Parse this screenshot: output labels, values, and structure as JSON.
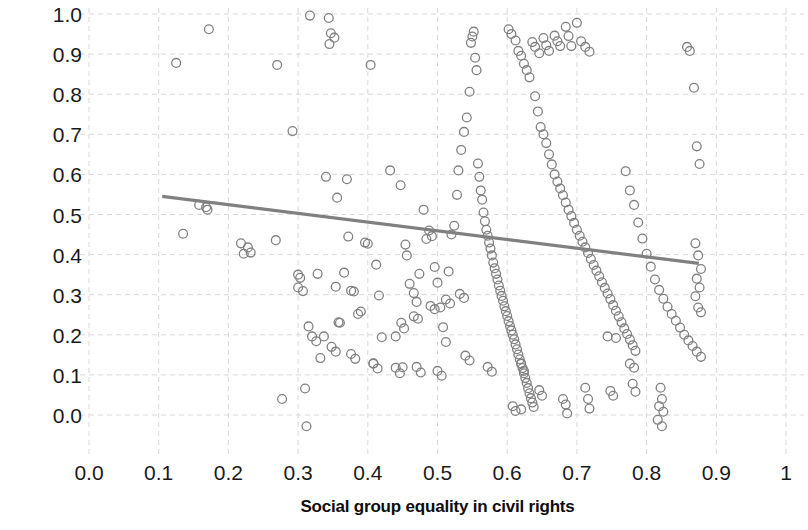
{
  "chart_data": {
    "type": "scatter",
    "title": "",
    "xlabel": "Social group equality in civil rights",
    "ylabel": "Female/male ratio",
    "xlim": [
      0.0,
      1.0
    ],
    "ylim": [
      -0.06,
      1.04
    ],
    "xticks": [
      "0.0",
      "0.1",
      "0.2",
      "0.3",
      "0.4",
      "0.5",
      "0.6",
      "0.7",
      "0.8",
      "0.9",
      "1"
    ],
    "xtick_values": [
      0.0,
      0.1,
      0.2,
      0.3,
      0.4,
      0.5,
      0.6,
      0.7,
      0.8,
      0.9,
      1.0
    ],
    "yticks": [
      "0.0",
      "0.1",
      "0.2",
      "0.3",
      "0.4",
      "0.5",
      "0.6",
      "0.7",
      "0.8",
      "0.9",
      "1.0"
    ],
    "ytick_values": [
      0.0,
      0.1,
      0.2,
      0.3,
      0.4,
      0.5,
      0.6,
      0.7,
      0.8,
      0.9,
      1.0
    ],
    "grid": true,
    "grid_style": "dashed",
    "grid_color": "#d9d9d9",
    "legend": "none",
    "marker": {
      "style": "open-circle",
      "radius": 4.4,
      "stroke": "#808080",
      "stroke_width": 1.3,
      "fill": "none"
    },
    "trendline": {
      "type": "linear",
      "color": "#808080",
      "width": 3.2,
      "x_start": 0.105,
      "y_start": 0.545,
      "x_end": 0.875,
      "y_end": 0.378,
      "slope": -0.217,
      "intercept": 0.568
    },
    "n_points": 270,
    "points": [
      [
        0.125,
        0.878
      ],
      [
        0.172,
        0.962
      ],
      [
        0.158,
        0.524
      ],
      [
        0.168,
        0.518
      ],
      [
        0.17,
        0.512
      ],
      [
        0.135,
        0.452
      ],
      [
        0.218,
        0.428
      ],
      [
        0.228,
        0.418
      ],
      [
        0.222,
        0.402
      ],
      [
        0.232,
        0.405
      ],
      [
        0.268,
        0.436
      ],
      [
        0.277,
        0.04
      ],
      [
        0.27,
        0.873
      ],
      [
        0.292,
        0.708
      ],
      [
        0.3,
        0.35
      ],
      [
        0.303,
        0.342
      ],
      [
        0.3,
        0.318
      ],
      [
        0.307,
        0.309
      ],
      [
        0.31,
        0.066
      ],
      [
        0.312,
        -0.028
      ],
      [
        0.315,
        0.221
      ],
      [
        0.317,
        0.996
      ],
      [
        0.328,
        0.352
      ],
      [
        0.332,
        0.142
      ],
      [
        0.337,
        0.196
      ],
      [
        0.34,
        0.594
      ],
      [
        0.344,
        0.99
      ],
      [
        0.347,
        0.952
      ],
      [
        0.345,
        0.925
      ],
      [
        0.352,
        0.941
      ],
      [
        0.354,
        0.32
      ],
      [
        0.356,
        0.542
      ],
      [
        0.358,
        0.231
      ],
      [
        0.36,
        0.23
      ],
      [
        0.366,
        0.355
      ],
      [
        0.37,
        0.588
      ],
      [
        0.372,
        0.445
      ],
      [
        0.376,
        0.31
      ],
      [
        0.38,
        0.308
      ],
      [
        0.386,
        0.252
      ],
      [
        0.39,
        0.258
      ],
      [
        0.396,
        0.43
      ],
      [
        0.4,
        0.427
      ],
      [
        0.404,
        0.873
      ],
      [
        0.408,
        0.129
      ],
      [
        0.412,
        0.375
      ],
      [
        0.416,
        0.298
      ],
      [
        0.42,
        0.194
      ],
      [
        0.432,
        0.61
      ],
      [
        0.44,
        0.196
      ],
      [
        0.447,
        0.573
      ],
      [
        0.45,
        0.119
      ],
      [
        0.454,
        0.425
      ],
      [
        0.456,
        0.398
      ],
      [
        0.46,
        0.327
      ],
      [
        0.466,
        0.304
      ],
      [
        0.47,
        0.282
      ],
      [
        0.474,
        0.352
      ],
      [
        0.48,
        0.512
      ],
      [
        0.484,
        0.439
      ],
      [
        0.488,
        0.46
      ],
      [
        0.492,
        0.446
      ],
      [
        0.496,
        0.369
      ],
      [
        0.5,
        0.33
      ],
      [
        0.504,
        0.268
      ],
      [
        0.508,
        0.219
      ],
      [
        0.512,
        0.182
      ],
      [
        0.516,
        0.358
      ],
      [
        0.52,
        0.45
      ],
      [
        0.524,
        0.472
      ],
      [
        0.528,
        0.549
      ],
      [
        0.53,
        0.61
      ],
      [
        0.534,
        0.661
      ],
      [
        0.538,
        0.706
      ],
      [
        0.542,
        0.742
      ],
      [
        0.546,
        0.806
      ],
      [
        0.548,
        0.928
      ],
      [
        0.55,
        0.944
      ],
      [
        0.552,
        0.956
      ],
      [
        0.554,
        0.891
      ],
      [
        0.556,
        0.86
      ],
      [
        0.558,
        0.627
      ],
      [
        0.56,
        0.594
      ],
      [
        0.562,
        0.56
      ],
      [
        0.564,
        0.537
      ],
      [
        0.566,
        0.505
      ],
      [
        0.568,
        0.483
      ],
      [
        0.57,
        0.462
      ],
      [
        0.572,
        0.447
      ],
      [
        0.574,
        0.43
      ],
      [
        0.576,
        0.415
      ],
      [
        0.578,
        0.398
      ],
      [
        0.58,
        0.38
      ],
      [
        0.582,
        0.366
      ],
      [
        0.584,
        0.352
      ],
      [
        0.586,
        0.338
      ],
      [
        0.588,
        0.323
      ],
      [
        0.59,
        0.31
      ],
      [
        0.592,
        0.297
      ],
      [
        0.594,
        0.285
      ],
      [
        0.596,
        0.271
      ],
      [
        0.598,
        0.259
      ],
      [
        0.6,
        0.247
      ],
      [
        0.602,
        0.234
      ],
      [
        0.604,
        0.222
      ],
      [
        0.606,
        0.211
      ],
      [
        0.608,
        0.2
      ],
      [
        0.61,
        0.189
      ],
      [
        0.612,
        0.176
      ],
      [
        0.614,
        0.164
      ],
      [
        0.616,
        0.151
      ],
      [
        0.618,
        0.139
      ],
      [
        0.62,
        0.128
      ],
      [
        0.622,
        0.117
      ],
      [
        0.624,
        0.104
      ],
      [
        0.626,
        0.092
      ],
      [
        0.628,
        0.08
      ],
      [
        0.63,
        0.067
      ],
      [
        0.632,
        0.054
      ],
      [
        0.634,
        0.042
      ],
      [
        0.636,
        0.031
      ],
      [
        0.638,
        0.02
      ],
      [
        0.608,
        0.022
      ],
      [
        0.612,
        0.01
      ],
      [
        0.62,
        0.014
      ],
      [
        0.602,
        0.962
      ],
      [
        0.606,
        0.95
      ],
      [
        0.612,
        0.934
      ],
      [
        0.616,
        0.908
      ],
      [
        0.62,
        0.896
      ],
      [
        0.624,
        0.876
      ],
      [
        0.628,
        0.86
      ],
      [
        0.632,
        0.842
      ],
      [
        0.64,
        0.795
      ],
      [
        0.644,
        0.757
      ],
      [
        0.648,
        0.718
      ],
      [
        0.652,
        0.7
      ],
      [
        0.656,
        0.678
      ],
      [
        0.66,
        0.65
      ],
      [
        0.664,
        0.625
      ],
      [
        0.668,
        0.6
      ],
      [
        0.672,
        0.582
      ],
      [
        0.676,
        0.565
      ],
      [
        0.68,
        0.548
      ],
      [
        0.684,
        0.53
      ],
      [
        0.688,
        0.512
      ],
      [
        0.692,
        0.496
      ],
      [
        0.696,
        0.479
      ],
      [
        0.7,
        0.462
      ],
      [
        0.704,
        0.447
      ],
      [
        0.708,
        0.432
      ],
      [
        0.712,
        0.418
      ],
      [
        0.716,
        0.404
      ],
      [
        0.72,
        0.389
      ],
      [
        0.724,
        0.374
      ],
      [
        0.728,
        0.36
      ],
      [
        0.732,
        0.346
      ],
      [
        0.736,
        0.331
      ],
      [
        0.74,
        0.317
      ],
      [
        0.744,
        0.303
      ],
      [
        0.748,
        0.289
      ],
      [
        0.752,
        0.274
      ],
      [
        0.756,
        0.26
      ],
      [
        0.76,
        0.246
      ],
      [
        0.764,
        0.231
      ],
      [
        0.768,
        0.216
      ],
      [
        0.772,
        0.202
      ],
      [
        0.776,
        0.188
      ],
      [
        0.78,
        0.174
      ],
      [
        0.784,
        0.16
      ],
      [
        0.7,
        0.978
      ],
      [
        0.706,
        0.932
      ],
      [
        0.712,
        0.918
      ],
      [
        0.718,
        0.906
      ],
      [
        0.684,
        0.968
      ],
      [
        0.688,
        0.945
      ],
      [
        0.692,
        0.92
      ],
      [
        0.668,
        0.946
      ],
      [
        0.672,
        0.932
      ],
      [
        0.676,
        0.92
      ],
      [
        0.652,
        0.94
      ],
      [
        0.656,
        0.922
      ],
      [
        0.66,
        0.908
      ],
      [
        0.636,
        0.93
      ],
      [
        0.64,
        0.918
      ],
      [
        0.646,
        0.902
      ],
      [
        0.77,
        0.608
      ],
      [
        0.776,
        0.56
      ],
      [
        0.782,
        0.524
      ],
      [
        0.788,
        0.48
      ],
      [
        0.794,
        0.44
      ],
      [
        0.8,
        0.402
      ],
      [
        0.806,
        0.37
      ],
      [
        0.812,
        0.338
      ],
      [
        0.818,
        0.312
      ],
      [
        0.824,
        0.29
      ],
      [
        0.83,
        0.27
      ],
      [
        0.836,
        0.252
      ],
      [
        0.842,
        0.235
      ],
      [
        0.848,
        0.218
      ],
      [
        0.854,
        0.2
      ],
      [
        0.86,
        0.186
      ],
      [
        0.866,
        0.172
      ],
      [
        0.872,
        0.158
      ],
      [
        0.878,
        0.145
      ],
      [
        0.858,
        0.918
      ],
      [
        0.862,
        0.908
      ],
      [
        0.868,
        0.816
      ],
      [
        0.872,
        0.67
      ],
      [
        0.876,
        0.626
      ],
      [
        0.87,
        0.428
      ],
      [
        0.874,
        0.398
      ],
      [
        0.878,
        0.364
      ],
      [
        0.872,
        0.34
      ],
      [
        0.876,
        0.318
      ],
      [
        0.87,
        0.296
      ],
      [
        0.874,
        0.268
      ],
      [
        0.878,
        0.256
      ],
      [
        0.82,
        0.068
      ],
      [
        0.822,
        0.04
      ],
      [
        0.818,
        0.022
      ],
      [
        0.824,
        0.008
      ],
      [
        0.816,
        -0.012
      ],
      [
        0.822,
        -0.028
      ],
      [
        0.78,
        0.078
      ],
      [
        0.784,
        0.058
      ],
      [
        0.776,
        0.128
      ],
      [
        0.782,
        0.118
      ],
      [
        0.748,
        0.06
      ],
      [
        0.752,
        0.048
      ],
      [
        0.744,
        0.196
      ],
      [
        0.756,
        0.192
      ],
      [
        0.712,
        0.068
      ],
      [
        0.716,
        0.04
      ],
      [
        0.718,
        0.016
      ],
      [
        0.68,
        0.04
      ],
      [
        0.684,
        0.026
      ],
      [
        0.686,
        0.004
      ],
      [
        0.646,
        0.062
      ],
      [
        0.65,
        0.048
      ],
      [
        0.62,
        0.128
      ],
      [
        0.624,
        0.11
      ],
      [
        0.572,
        0.12
      ],
      [
        0.578,
        0.108
      ],
      [
        0.54,
        0.148
      ],
      [
        0.546,
        0.136
      ],
      [
        0.5,
        0.11
      ],
      [
        0.506,
        0.098
      ],
      [
        0.47,
        0.12
      ],
      [
        0.476,
        0.106
      ],
      [
        0.44,
        0.118
      ],
      [
        0.446,
        0.104
      ],
      [
        0.408,
        0.128
      ],
      [
        0.414,
        0.116
      ],
      [
        0.376,
        0.152
      ],
      [
        0.382,
        0.14
      ],
      [
        0.348,
        0.17
      ],
      [
        0.354,
        0.158
      ],
      [
        0.32,
        0.196
      ],
      [
        0.326,
        0.184
      ],
      [
        0.448,
        0.23
      ],
      [
        0.452,
        0.216
      ],
      [
        0.466,
        0.246
      ],
      [
        0.472,
        0.24
      ],
      [
        0.49,
        0.272
      ],
      [
        0.496,
        0.264
      ],
      [
        0.512,
        0.288
      ],
      [
        0.518,
        0.278
      ],
      [
        0.532,
        0.302
      ],
      [
        0.538,
        0.292
      ]
    ]
  },
  "axes": {
    "x_title": "Social group equality in civil rights",
    "y_title": "Female/male ratio",
    "x_tick_labels": [
      "0.0",
      "0.1",
      "0.2",
      "0.3",
      "0.4",
      "0.5",
      "0.6",
      "0.7",
      "0.8",
      "0.9",
      "1"
    ],
    "y_tick_labels": [
      "1.0",
      "0.9",
      "0.8",
      "0.7",
      "0.6",
      "0.5",
      "0.4",
      "0.3",
      "0.2",
      "0.1",
      "0.0"
    ]
  },
  "colors": {
    "marker_stroke": "#808080",
    "trendline": "#808080",
    "grid": "#d9d9d9",
    "text": "#1a1a1a",
    "background": "#ffffff"
  }
}
